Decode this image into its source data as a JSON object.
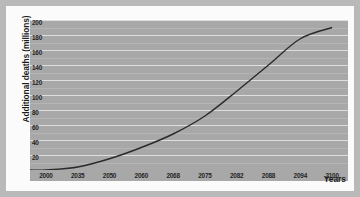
{
  "chart_data": {
    "type": "line",
    "title": "",
    "xlabel": "Years",
    "ylabel": "Additional deaths (millions)",
    "categories": [
      "2000",
      "2035",
      "2050",
      "2060",
      "2068",
      "2075",
      "2082",
      "2088",
      "2094",
      "2100"
    ],
    "values": [
      0,
      4,
      15,
      30,
      48,
      72,
      105,
      140,
      175,
      190
    ],
    "series": [
      {
        "name": "Additional deaths",
        "values": [
          0,
          4,
          15,
          30,
          48,
          72,
          105,
          140,
          175,
          190
        ]
      }
    ],
    "ylim": [
      0,
      200
    ],
    "yticks": [
      0,
      20,
      40,
      60,
      80,
      100,
      120,
      140,
      160,
      180,
      200
    ],
    "ytick_labels": [
      "0",
      "20",
      "40",
      "60",
      "80",
      "100",
      "120",
      "140",
      "160",
      "180",
      "200"
    ],
    "grid": true,
    "legend": false,
    "legend_position": "none",
    "line_color": "#2b2b2b",
    "plot_background": "#a8a8a8",
    "gridline_color": "#dedede",
    "figure_background": "#b9b9b9",
    "card_background": "#fbfbfb"
  }
}
